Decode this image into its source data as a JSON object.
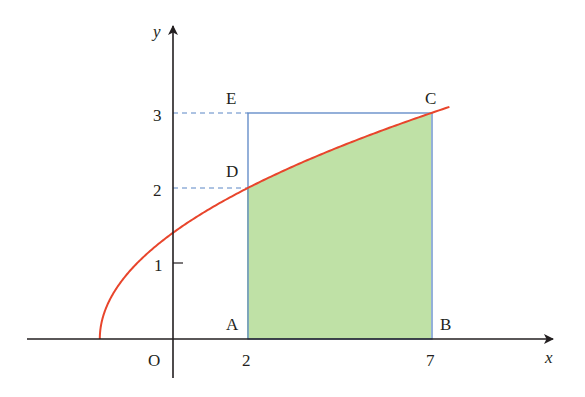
{
  "figure": {
    "axes": {
      "x_label": "x",
      "y_label": "y",
      "origin_label": "O",
      "x_ticks": [
        {
          "value": 2,
          "label": "2"
        },
        {
          "value": 7,
          "label": "7"
        }
      ],
      "y_ticks": [
        {
          "value": 1,
          "label": "1"
        },
        {
          "value": 2,
          "label": "2"
        },
        {
          "value": 3,
          "label": "3"
        }
      ]
    },
    "points": [
      {
        "name": "A",
        "label": "A",
        "x": 2,
        "y": 0
      },
      {
        "name": "B",
        "label": "B",
        "x": 7,
        "y": 0
      },
      {
        "name": "C",
        "label": "C",
        "x": 7,
        "y": 3
      },
      {
        "name": "D",
        "label": "D",
        "x": 2,
        "y": 2
      },
      {
        "name": "E",
        "label": "E",
        "x": 2,
        "y": 3
      }
    ],
    "curve": {
      "equation": "y = sqrt(x + 2)",
      "domain": [
        -2,
        7.5
      ],
      "color": "#e8452c"
    },
    "colors": {
      "axis": "#231f20",
      "rectangle": "#5b86c5",
      "dashed_guides": "#5b86c5",
      "shaded_region": "#bfe1a6",
      "curve": "#e8452c"
    }
  }
}
